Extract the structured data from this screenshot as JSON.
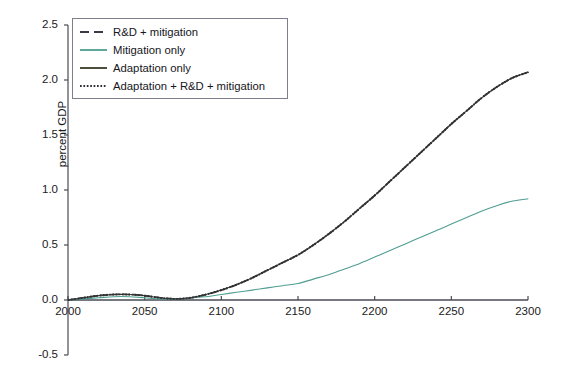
{
  "chart_data": {
    "type": "line",
    "title": "",
    "xlabel": "",
    "ylabel": "percent GDP",
    "xlim": [
      2000,
      2300
    ],
    "ylim": [
      -0.5,
      2.5
    ],
    "xticks": [
      2000,
      2050,
      2100,
      2150,
      2200,
      2250,
      2300
    ],
    "xtick_labels": [
      "2000",
      "2050",
      "2100",
      "2150",
      "2200",
      "2250",
      "2300"
    ],
    "yticks": [
      -0.5,
      0.0,
      0.5,
      1.0,
      1.5,
      2.0,
      2.5
    ],
    "ytick_labels": [
      "-0.5",
      "0.0",
      "0.5",
      "1.0",
      "1.5",
      "2.0",
      "2.5"
    ],
    "grid": false,
    "legend_position": "upper left",
    "x": [
      2000,
      2010,
      2020,
      2030,
      2040,
      2050,
      2060,
      2070,
      2080,
      2090,
      2100,
      2110,
      2120,
      2130,
      2140,
      2150,
      2160,
      2170,
      2180,
      2190,
      2200,
      2210,
      2220,
      2230,
      2240,
      2250,
      2260,
      2270,
      2280,
      2290,
      2300
    ],
    "series": [
      {
        "name": "R&D + mitigation",
        "style": "dashed",
        "color": "#3b3b46",
        "values": [
          0.0,
          0.02,
          0.04,
          0.05,
          0.05,
          0.04,
          0.02,
          0.01,
          0.02,
          0.05,
          0.09,
          0.14,
          0.2,
          0.27,
          0.34,
          0.41,
          0.5,
          0.6,
          0.71,
          0.83,
          0.95,
          1.08,
          1.21,
          1.34,
          1.47,
          1.6,
          1.72,
          1.84,
          1.94,
          2.02,
          2.07
        ]
      },
      {
        "name": "Mitigation only",
        "style": "solid",
        "color": "#4f9e91",
        "values": [
          0.0,
          0.01,
          0.02,
          0.03,
          0.03,
          0.02,
          0.01,
          0.01,
          0.02,
          0.03,
          0.05,
          0.07,
          0.09,
          0.11,
          0.13,
          0.15,
          0.19,
          0.23,
          0.28,
          0.33,
          0.39,
          0.45,
          0.51,
          0.57,
          0.63,
          0.69,
          0.75,
          0.81,
          0.86,
          0.9,
          0.92
        ]
      },
      {
        "name": "Adaptation only",
        "style": "solid",
        "color": "#3a3a28",
        "values": [
          0.0,
          0.02,
          0.04,
          0.05,
          0.05,
          0.04,
          0.02,
          0.01,
          0.02,
          0.05,
          0.09,
          0.14,
          0.2,
          0.27,
          0.34,
          0.41,
          0.5,
          0.6,
          0.71,
          0.83,
          0.95,
          1.08,
          1.21,
          1.34,
          1.47,
          1.6,
          1.72,
          1.84,
          1.94,
          2.02,
          2.07
        ]
      },
      {
        "name": "Adaptation + R&D + mitigation",
        "style": "dotted",
        "color": "#2e2e3a",
        "values": [
          0.0,
          0.02,
          0.04,
          0.05,
          0.05,
          0.04,
          0.02,
          0.01,
          0.02,
          0.05,
          0.09,
          0.14,
          0.2,
          0.27,
          0.34,
          0.41,
          0.5,
          0.6,
          0.71,
          0.83,
          0.95,
          1.08,
          1.21,
          1.34,
          1.47,
          1.6,
          1.72,
          1.84,
          1.94,
          2.02,
          2.07
        ]
      }
    ]
  },
  "legend": {
    "items": [
      {
        "label": "R&D + mitigation",
        "style": "dashed",
        "color": "#3b3b46"
      },
      {
        "label": "Mitigation only",
        "style": "solid",
        "color": "#4f9e91"
      },
      {
        "label": "Adaptation only",
        "style": "solid",
        "color": "#3a3a28"
      },
      {
        "label": "Adaptation + R&D + mitigation",
        "style": "dotted",
        "color": "#2e2e3a"
      }
    ]
  },
  "caption": {
    "text": ""
  },
  "colors": {
    "axis": "#4a4a55",
    "text": "#1a1a1a",
    "legend_border": "#7d7d8c",
    "background": "#ffffff"
  }
}
